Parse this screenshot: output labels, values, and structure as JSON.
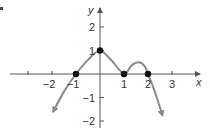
{
  "chart_data": {
    "type": "line",
    "title": "",
    "xlabel": "x",
    "ylabel": "y",
    "xlim": [
      -3.5,
      3.9
    ],
    "ylim": [
      -2.3,
      2.9
    ],
    "x_ticks": [
      -2,
      -1,
      1,
      2,
      3
    ],
    "x_tick_labels": [
      "−2",
      "−1",
      "1",
      "2",
      "3"
    ],
    "y_ticks": [
      2,
      1,
      -1,
      -2
    ],
    "y_tick_labels": [
      "2",
      "1",
      "−1",
      "−2"
    ],
    "grid": false,
    "legend": null,
    "series": [
      {
        "name": "f(x)",
        "points": [
          [
            -1.95,
            -1.6
          ],
          [
            -1.5,
            -0.75
          ],
          [
            -1,
            0
          ],
          [
            -0.5,
            0.6
          ],
          [
            0,
            1
          ],
          [
            0.5,
            0.55
          ],
          [
            1,
            0
          ],
          [
            1.3,
            0.35
          ],
          [
            1.6,
            0.5
          ],
          [
            1.85,
            0.35
          ],
          [
            2,
            0
          ],
          [
            2.3,
            -0.8
          ],
          [
            2.6,
            -1.75
          ]
        ],
        "arrows_at_ends": true,
        "color": "#8a8a8a"
      }
    ],
    "highlighted_points": [
      [
        -1,
        0
      ],
      [
        0,
        1
      ],
      [
        1,
        0
      ],
      [
        2,
        0
      ]
    ],
    "annotations": []
  },
  "colors": {
    "axis": "#555555",
    "curve": "#8a8a8a",
    "points": "#111111",
    "text": "#333333"
  }
}
